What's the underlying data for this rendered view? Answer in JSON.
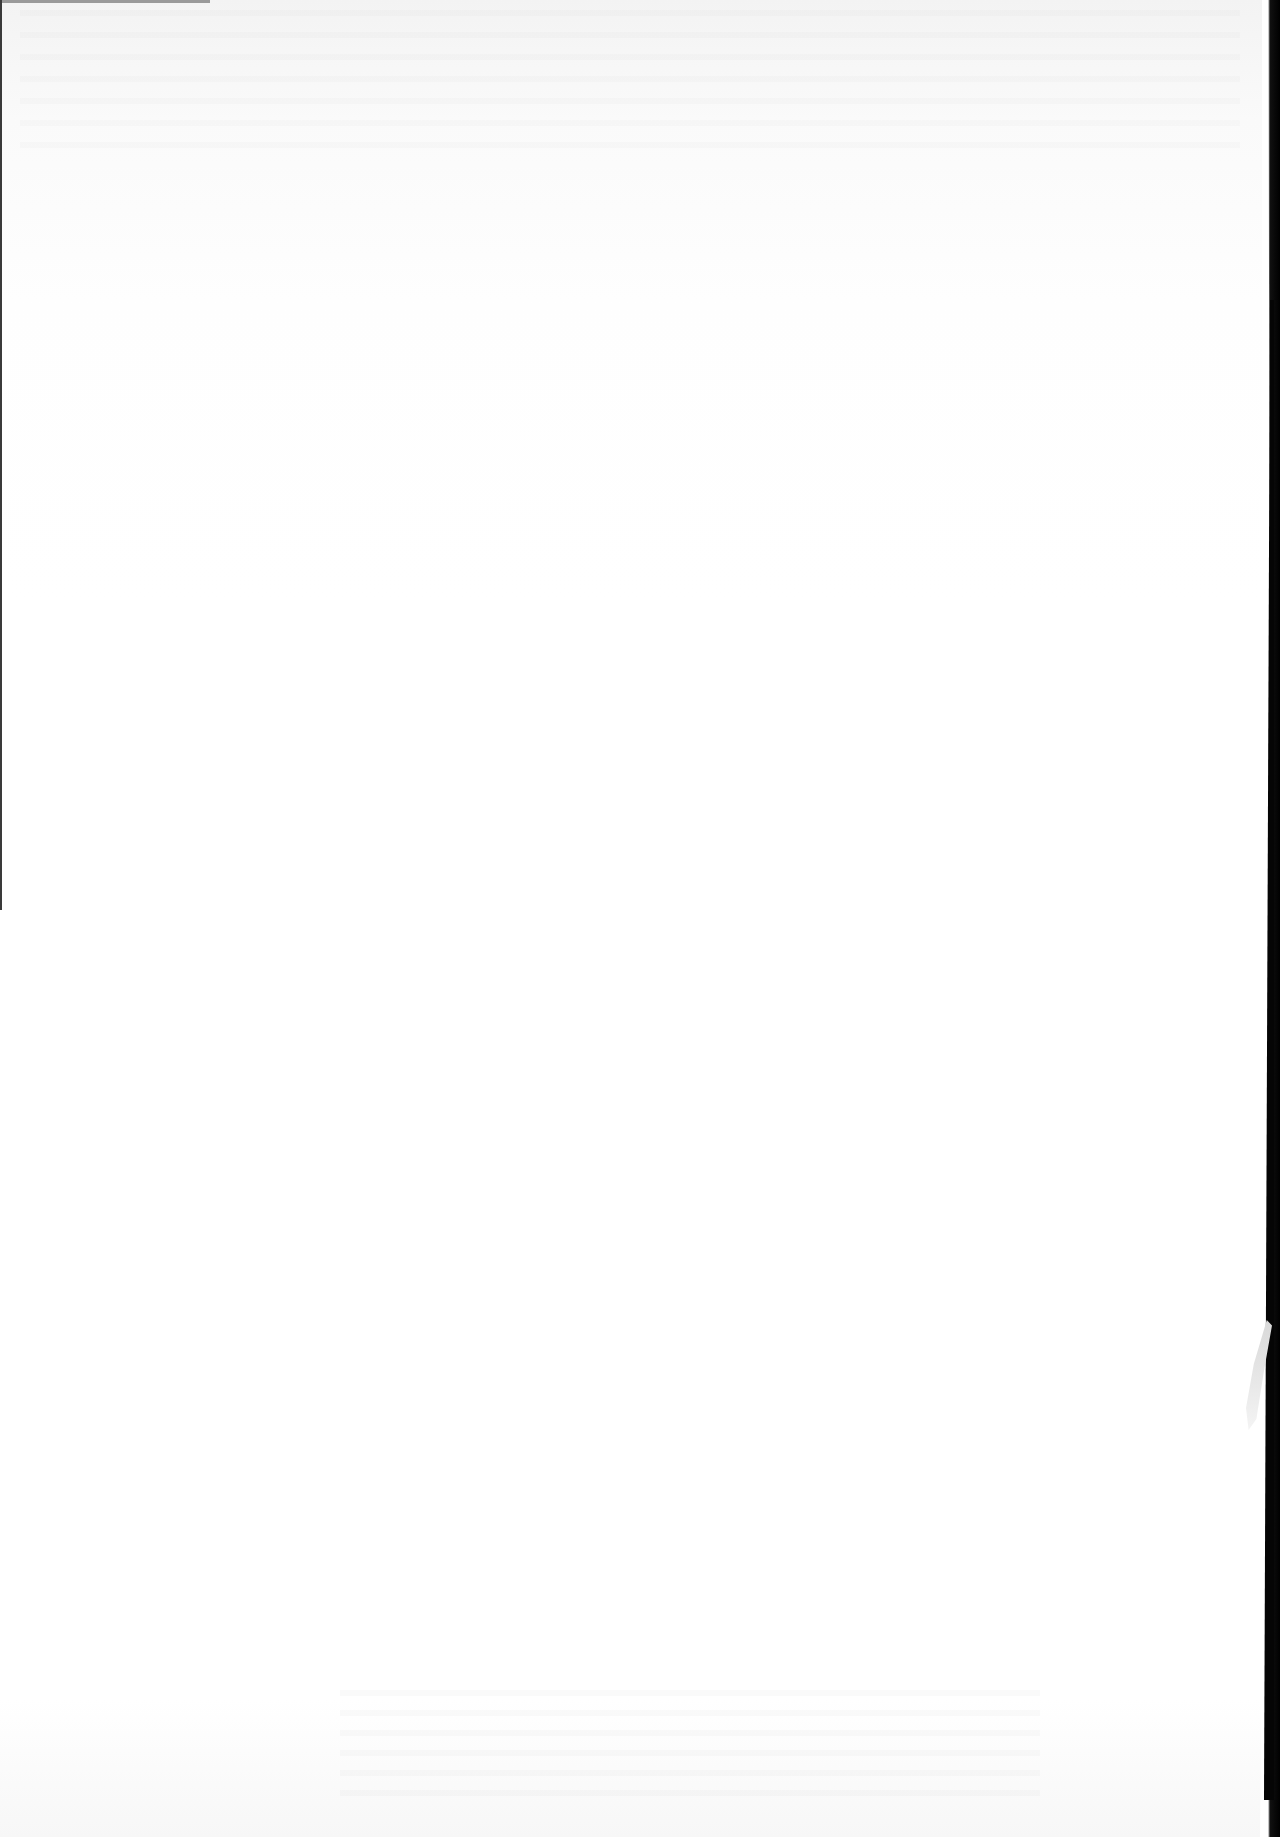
{
  "document": {
    "type": "scanned-page",
    "content": "",
    "state": "blank page with faint reverse-side bleed-through"
  },
  "colors": {
    "paper": "#ffffff",
    "scan_border": "#000000"
  }
}
